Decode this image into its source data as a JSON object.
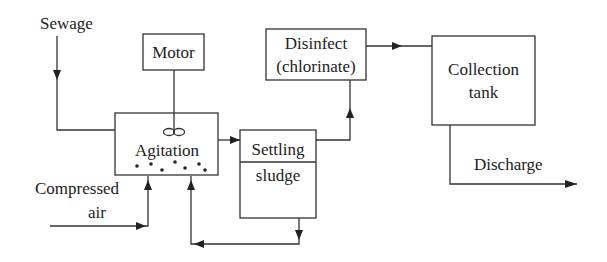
{
  "diagram": {
    "type": "process-flow",
    "nodes": {
      "motor": {
        "label": "Motor"
      },
      "agitation": {
        "label": "Agitation"
      },
      "settling": {
        "label_top": "Settling",
        "label_bottom": "sludge"
      },
      "disinfect": {
        "line1": "Disinfect",
        "line2": "(chlorinate)"
      },
      "collection": {
        "line1": "Collection",
        "line2": "tank"
      }
    },
    "inputs": {
      "sewage": "Sewage",
      "compressed_air_line1": "Compressed",
      "compressed_air_line2": "air"
    },
    "outputs": {
      "discharge": "Discharge"
    },
    "edges": [
      {
        "from": "sewage",
        "to": "agitation"
      },
      {
        "from": "motor",
        "to": "agitation"
      },
      {
        "from": "compressed_air",
        "to": "agitation"
      },
      {
        "from": "agitation",
        "to": "settling"
      },
      {
        "from": "settling",
        "to": "disinfect"
      },
      {
        "from": "settling",
        "to": "agitation",
        "note": "sludge return"
      },
      {
        "from": "disinfect",
        "to": "collection"
      },
      {
        "from": "collection",
        "to": "discharge"
      }
    ]
  }
}
